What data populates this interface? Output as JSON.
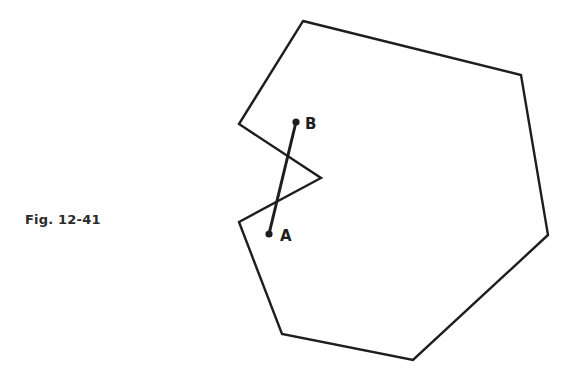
{
  "caption": "Fig. 12-41",
  "colors": {
    "stroke": "#1e1e1e",
    "background": "#ffffff"
  },
  "polygon": {
    "description": "non-convex polygon with an inward notch on the left side",
    "vertices": [
      [
        303,
        21
      ],
      [
        521,
        75
      ],
      [
        548,
        235
      ],
      [
        413,
        360
      ],
      [
        282,
        334
      ],
      [
        239,
        222
      ],
      [
        321,
        178
      ],
      [
        239,
        124
      ]
    ]
  },
  "segment": {
    "from": "A",
    "to": "B",
    "passes_outside_polygon": true
  },
  "points": {
    "A": {
      "label": "A",
      "x": 269,
      "y": 234
    },
    "B": {
      "label": "B",
      "x": 296,
      "y": 122
    }
  }
}
